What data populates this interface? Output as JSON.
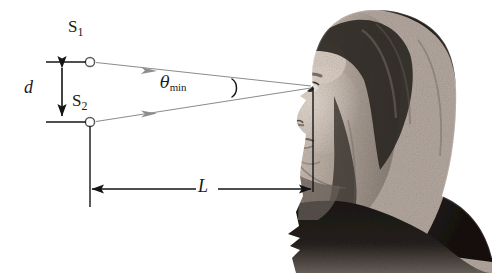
{
  "figure": {
    "kind": "optics-resolution-diagram",
    "background_color": "#ffffff",
    "ray_color": "#8c8c8c",
    "line_color": "#1a1a1a"
  },
  "labels": {
    "source_top": {
      "base": "S",
      "sub": "1"
    },
    "source_bottom": {
      "base": "S",
      "sub": "2"
    },
    "separation": "d",
    "angle": {
      "symbol": "θ",
      "sub": "min"
    },
    "distance": "L"
  },
  "geometry": {
    "source_top_point": {
      "x": 90,
      "y": 62
    },
    "source_bottom_point": {
      "x": 90,
      "y": 122
    },
    "eye_point": {
      "x": 313,
      "y": 87
    },
    "d_arrow": {
      "x": 62,
      "y_top": 62,
      "y_bottom": 122
    },
    "L_arrow": {
      "y": 189,
      "x_left": 90,
      "x_right": 312
    }
  },
  "subject": {
    "name": "woman-head-profile",
    "facing": "left",
    "hair_color": "#2a2624",
    "skin_color": "#b9ada4"
  }
}
